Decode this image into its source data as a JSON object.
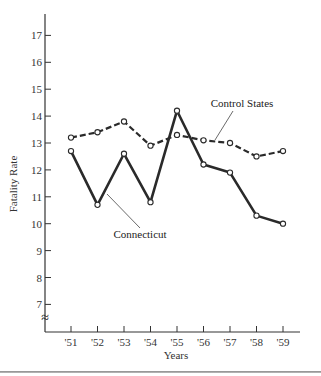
{
  "chart_data": {
    "type": "line",
    "title": "",
    "xlabel": "Years",
    "ylabel": "Fatality Rate",
    "categories": [
      "'51",
      "'52",
      "'53",
      "'54",
      "'55",
      "'56",
      "'57",
      "'58",
      "'59"
    ],
    "yticks": [
      7,
      8,
      9,
      10,
      11,
      12,
      13,
      14,
      15,
      16,
      17
    ],
    "ylim": [
      6.3,
      17.9
    ],
    "axis_break": "≈",
    "grid": false,
    "legend": "inline annotations",
    "series": [
      {
        "name": "Connecticut",
        "style": "solid",
        "marker": "open-circle",
        "values": [
          12.7,
          10.7,
          12.6,
          10.8,
          14.2,
          12.2,
          11.9,
          10.3,
          10.0
        ]
      },
      {
        "name": "Control States",
        "style": "dashed",
        "marker": "open-circle",
        "values": [
          13.2,
          13.4,
          13.8,
          12.9,
          13.3,
          13.1,
          13.0,
          12.5,
          12.7
        ]
      }
    ],
    "annotations": [
      {
        "text": "Connecticut",
        "points_to": "Connecticut series near '52–'53"
      },
      {
        "text": "Control States",
        "points_to": "Control States series near '56–'57"
      }
    ]
  },
  "labels": {
    "ylabel": "Fatality Rate",
    "xlabel": "Years",
    "connecticut": "Connecticut",
    "control": "Control States",
    "axis_break": "≈"
  }
}
